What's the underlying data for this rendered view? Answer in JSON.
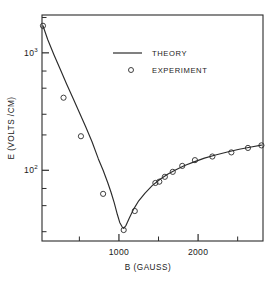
{
  "chart_data": {
    "type": "line",
    "title": "",
    "xlabel": "B (GAUSS)",
    "ylabel": "E (VOLTS /CM)",
    "xlim": [
      28,
      2820
    ],
    "ylim": [
      25,
      2100
    ],
    "yscale": "log",
    "xscale": "linear",
    "grid": false,
    "legend_position": "upper-center",
    "x_tick_labels": [
      "1000",
      "2000"
    ],
    "x_tick_values": [
      1000,
      2000
    ],
    "x_minor_ticks": [
      500,
      1500,
      2500
    ],
    "y_tick_labels": [
      "10",
      "10"
    ],
    "y_tick_exponents": [
      "3",
      "2"
    ],
    "y_tick_values": [
      1000,
      100
    ],
    "y_minor_ticks": [
      2000,
      700,
      500,
      300,
      200,
      70,
      50,
      30
    ],
    "series": [
      {
        "name": "THEORY",
        "style": "line",
        "x": [
          40,
          100,
          180,
          260,
          340,
          420,
          500,
          580,
          660,
          740,
          800,
          860,
          900,
          940,
          980,
          1010,
          1040,
          1060,
          1090,
          1130,
          1180,
          1250,
          1330,
          1420,
          1520,
          1620,
          1720,
          1830,
          1950,
          2080,
          2220,
          2370,
          2520,
          2670,
          2800
        ],
        "y": [
          1700,
          1300,
          960,
          720,
          540,
          410,
          310,
          235,
          175,
          125,
          100,
          78,
          65,
          53,
          42,
          36,
          33,
          32,
          34,
          39,
          46,
          55,
          64,
          74,
          84,
          93,
          101,
          110,
          118,
          127,
          135,
          143,
          151,
          158,
          164
        ]
      },
      {
        "name": "EXPERIMENT",
        "style": "markers",
        "marker": "open-circle",
        "x": [
          40,
          300,
          520,
          800,
          1060,
          1200,
          1460,
          1510,
          1580,
          1680,
          1800,
          1960,
          2180,
          2420,
          2630,
          2800
        ],
        "y": [
          1700,
          415,
          195,
          63,
          31,
          45,
          78,
          80,
          88,
          97,
          109,
          122,
          131,
          142,
          155,
          163
        ]
      }
    ],
    "legend": [
      {
        "label": "THEORY",
        "marker": "line"
      },
      {
        "label": "EXPERIMENT",
        "marker": "open-circle"
      }
    ]
  }
}
